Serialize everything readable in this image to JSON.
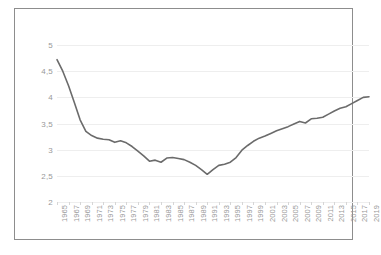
{
  "chart_data": {
    "type": "line",
    "title": "",
    "subtitle": "",
    "xlabel": "",
    "ylabel": "",
    "ylim": [
      2,
      5
    ],
    "yticks": [
      2,
      2.5,
      3,
      3.5,
      4,
      4.5,
      5
    ],
    "ytick_labels": [
      "2",
      "2,5",
      "3",
      "3,5",
      "4",
      "4,5",
      "5"
    ],
    "grid": true,
    "legend": false,
    "legend_position": "none",
    "xtick_labels": [
      "1965",
      "1967",
      "1969",
      "1971",
      "1973",
      "1975",
      "1977",
      "1979",
      "1981",
      "1983",
      "1985",
      "1987",
      "1989",
      "1991",
      "1993",
      "1995",
      "1997",
      "1999",
      "2001",
      "2003",
      "2005",
      "2007",
      "2009",
      "2011",
      "2013",
      "2015",
      "2017",
      "2019"
    ],
    "x": [
      1965,
      1966,
      1967,
      1968,
      1969,
      1970,
      1971,
      1972,
      1973,
      1974,
      1975,
      1976,
      1977,
      1978,
      1979,
      1980,
      1981,
      1982,
      1983,
      1984,
      1985,
      1986,
      1987,
      1988,
      1989,
      1990,
      1991,
      1992,
      1993,
      1994,
      1995,
      1996,
      1997,
      1998,
      1999,
      2000,
      2001,
      2002,
      2003,
      2004,
      2005,
      2006,
      2007,
      2008,
      2009,
      2010,
      2011,
      2012,
      2013,
      2014,
      2015,
      2016,
      2017,
      2018,
      2019
    ],
    "series": [
      {
        "name": "value",
        "color": "#6b6b6b",
        "values": [
          4.72,
          4.5,
          4.22,
          3.9,
          3.57,
          3.35,
          3.27,
          3.22,
          3.2,
          3.19,
          3.14,
          3.17,
          3.13,
          3.06,
          2.97,
          2.88,
          2.78,
          2.8,
          2.76,
          2.84,
          2.85,
          2.83,
          2.81,
          2.76,
          2.7,
          2.62,
          2.53,
          2.62,
          2.7,
          2.72,
          2.76,
          2.85,
          2.99,
          3.08,
          3.16,
          3.22,
          3.26,
          3.31,
          3.36,
          3.4,
          3.44,
          3.49,
          3.54,
          3.51,
          3.59,
          3.6,
          3.62,
          3.68,
          3.74,
          3.79,
          3.82,
          3.88,
          3.94,
          4.0,
          4.01
        ]
      }
    ]
  },
  "axis": {
    "y_min_label": "2",
    "y_max_label": "5"
  }
}
